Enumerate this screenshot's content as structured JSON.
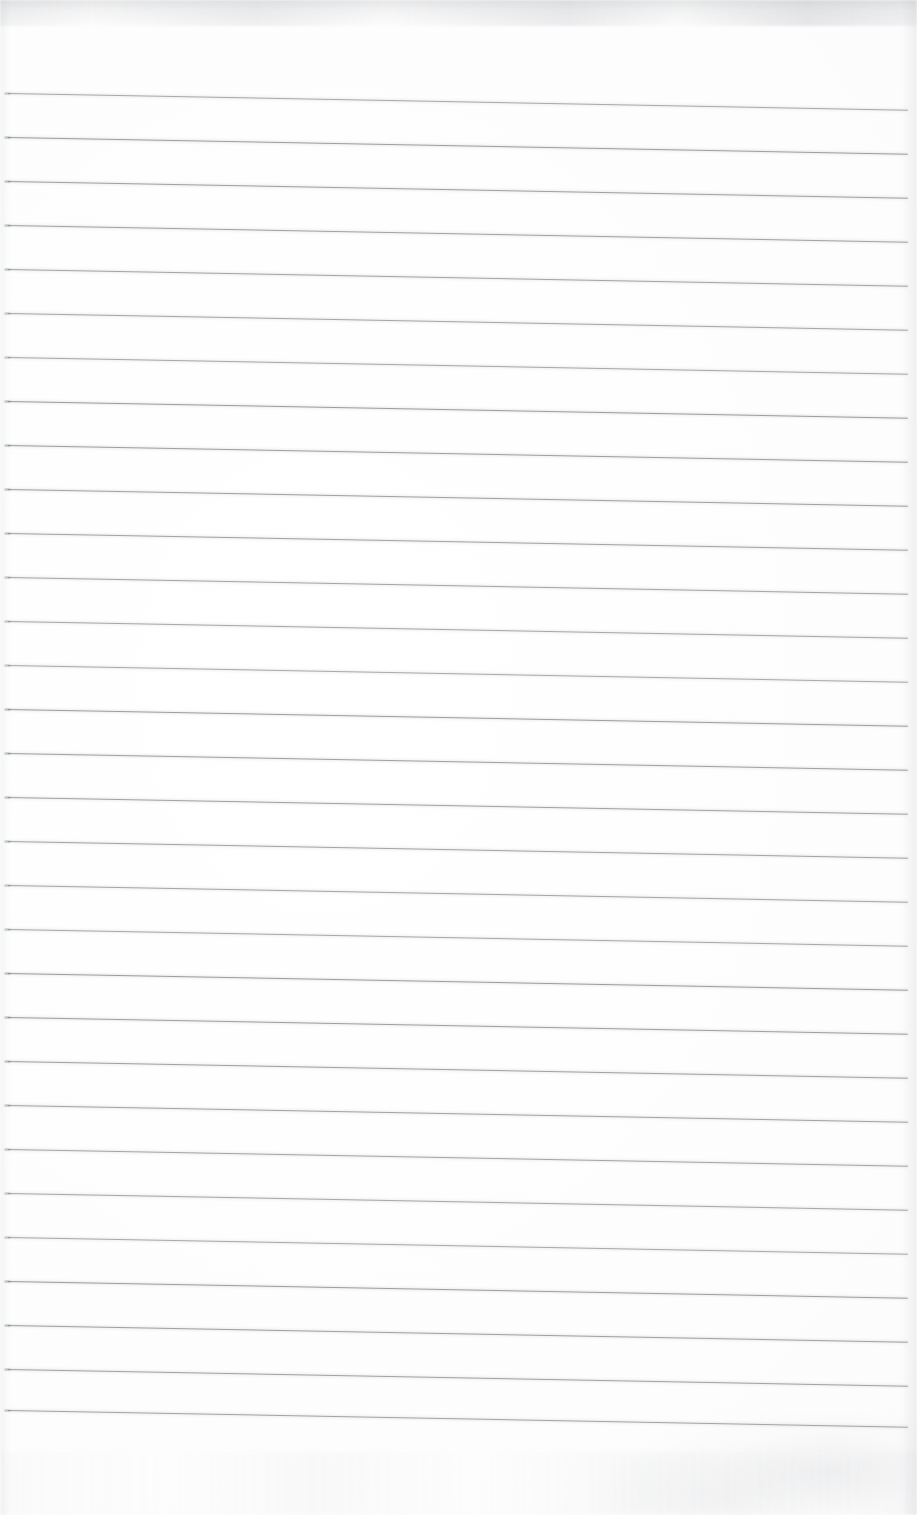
{
  "document": {
    "kind": "scanned-page",
    "description": "Blank lined notebook page",
    "page_width": 917,
    "page_height": 1515,
    "content_text": "",
    "has_handwriting": false,
    "has_printed_text": false
  },
  "paper": {
    "background_color": "#fdfdfd",
    "edge_tint_color": "#b0b2b6"
  },
  "ruling": {
    "type": "horizontal-ruled",
    "line_color": "#9a9ca0",
    "line_thickness_px": 1,
    "line_count": 31,
    "first_line_y": 93,
    "line_spacing_px": 44,
    "line_start_x": 8,
    "line_end_x": 908,
    "skew_degrees": 1.06,
    "top_margin_px": 93,
    "bottom_margin_px": 105,
    "left_margin_px": 8,
    "right_margin_px": 9,
    "vertical_margin_rule": false,
    "line_positions_y": [
      93,
      137,
      181,
      225,
      269,
      313,
      357,
      401,
      445,
      489,
      533,
      577,
      621,
      665,
      709,
      753,
      797,
      841,
      885,
      929,
      973,
      1017,
      1061,
      1105,
      1149,
      1193,
      1237,
      1281,
      1325,
      1369,
      1410
    ]
  },
  "artifacts": {
    "top_edge_mottling": true,
    "right_edge_shadow": true,
    "left_edge_shadow": true,
    "bottom_right_smudge": true
  }
}
